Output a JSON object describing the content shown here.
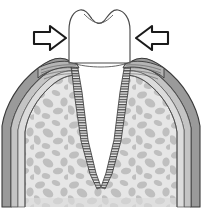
{
  "figure": {
    "type": "line-drawing",
    "width": 202,
    "height": 213,
    "background_color": "#ffffff",
    "caption": ""
  },
  "palette": {
    "background": "#ffffff",
    "outline": "#3a3a3a",
    "outline_dark": "#222222",
    "tooth_fill": "#ffffff",
    "gingiva_outer": "#9a9a9a",
    "gingiva_mid": "#c2c2c2",
    "gingiva_inner": "#d8d8d8",
    "bone_fill": "#e3e3e3",
    "bone_trabecula": "#b9b9b9",
    "bone_edge_band": "#d2d2d2",
    "ligament_stripe": "#4a4a4a",
    "ligament_base": "#e8e8e8",
    "arrow_fill": "#ffffff",
    "arrow_stroke": "#1a1a1a"
  },
  "parts": [
    {
      "id": "crown",
      "label": "Tooth crown",
      "description": "White enamel crown with occlusal notch at the incisal surface",
      "fill": "#ffffff"
    },
    {
      "id": "root",
      "label": "Tooth root",
      "description": "Tapered white root descending into the alveolus, apex at bottom",
      "fill": "#ffffff"
    },
    {
      "id": "gingiva-left",
      "label": "Left gingiva",
      "description": "Dark gray gum tissue wedge overlying the alveolar crest",
      "fill": "#9a9a9a"
    },
    {
      "id": "gingiva-right",
      "label": "Right gingiva",
      "description": "Dark gray gum tissue wedge overlying the alveolar crest",
      "fill": "#9a9a9a"
    },
    {
      "id": "alveolar-bone-left",
      "label": "Left alveolar bone",
      "description": "Light gray trabecular bone with mottled cancellous pattern",
      "fill": "#e3e3e3"
    },
    {
      "id": "alveolar-bone-right",
      "label": "Right alveolar bone",
      "description": "Light gray trabecular bone with mottled cancellous pattern",
      "fill": "#e3e3e3"
    },
    {
      "id": "periodontal-ligament-left",
      "label": "Left periodontal ligament",
      "description": "Hatched striped band between root surface and alveolar bone",
      "fill": "#4a4a4a"
    },
    {
      "id": "periodontal-ligament-right",
      "label": "Right periodontal ligament",
      "description": "Hatched striped band between root surface and alveolar bone",
      "fill": "#4a4a4a"
    },
    {
      "id": "arrow-left",
      "label": "Left pressure arrow",
      "direction": "right",
      "description": "Outlined block arrow pointing right toward the crown"
    },
    {
      "id": "arrow-right",
      "label": "Right pressure arrow",
      "direction": "left",
      "description": "Outlined block arrow pointing left toward the crown"
    }
  ],
  "arrows": [
    {
      "id": "arrow-left",
      "direction": "right",
      "x": 34,
      "y": 38,
      "length": 32
    },
    {
      "id": "arrow-right",
      "direction": "left",
      "x": 168,
      "y": 38,
      "length": 32
    }
  ]
}
